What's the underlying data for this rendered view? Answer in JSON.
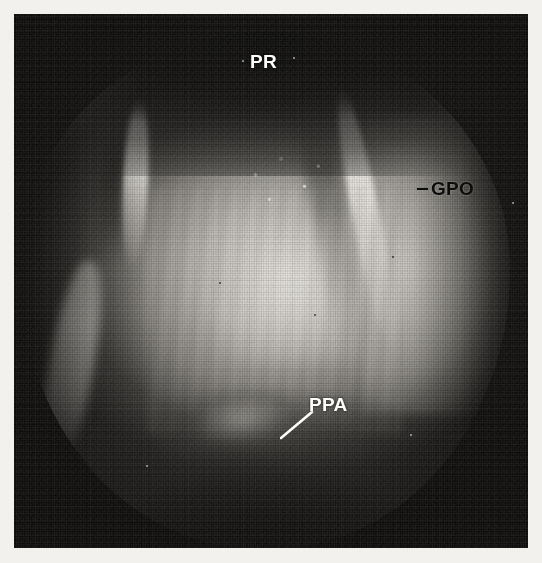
{
  "figure": {
    "type": "endoscopic-photograph",
    "modality": "laryngoscopy",
    "rendering": "halftone-screened scanned print",
    "frame": {
      "background_color": "#ffffff",
      "plate_color": "#0a0908",
      "margin_px": 14
    },
    "field_of_view": {
      "shape": "circular",
      "illumination": "central bright, peripheral vignette"
    }
  },
  "annotations": [
    {
      "id": "pr",
      "text": "PR",
      "color": "#fdfdfb",
      "style": "light",
      "leader": "none",
      "position": {
        "x": 236,
        "y": 38
      },
      "region": "superior dark band"
    },
    {
      "id": "gpo",
      "text": "GPO",
      "color": "#0d0d0c",
      "style": "dark",
      "leader": "dash-left",
      "position": {
        "x": 403,
        "y": 165
      },
      "region": "right bright tissue ridge"
    },
    {
      "id": "ppa",
      "text": "PPA",
      "color": "#fdfdfb",
      "style": "light",
      "leader": "diagonal-line-lower-left",
      "position": {
        "x": 295,
        "y": 381
      },
      "region": "inferior dark field, bright nodule"
    }
  ],
  "leader_lines": [
    {
      "id": "ppa-leader",
      "color": "#fdfdfb",
      "from": {
        "x": 266,
        "y": 424
      },
      "to": {
        "x": 298,
        "y": 398
      },
      "width": 2.4
    }
  ],
  "structures": [
    {
      "id": "ridge-left-upper",
      "label": "bright vertical fold, left of midline"
    },
    {
      "id": "ridge-left-lower",
      "label": "bright diagonal fold, lower left"
    },
    {
      "id": "ridge-right",
      "label": "bright diagonal ridge, right (GPO)"
    },
    {
      "id": "ppa-nodule",
      "label": "small bright mound, inferior midline (PPA)"
    },
    {
      "id": "striations",
      "label": "vertical mucosal striations across central tissue"
    }
  ]
}
